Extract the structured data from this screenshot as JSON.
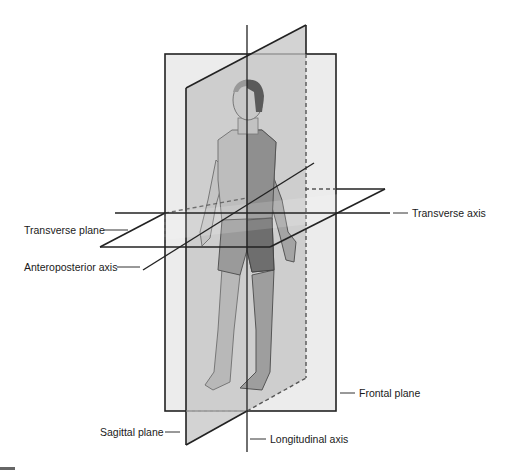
{
  "figure": {
    "colors": {
      "frontal_plane_fill": "#ececec",
      "sagittal_plane_fill": "#c8c8c8",
      "line": "#222222",
      "skin_shaded": "#b9b9b9",
      "skin_light": "#d6d6d6",
      "garment": "#7a7a7a",
      "hair": "#555555"
    },
    "labels": {
      "transverse_plane": "Transverse plane",
      "anteroposterior_axis": "Anteroposterior axis",
      "transverse_axis": "Transverse axis",
      "frontal_plane": "Frontal plane",
      "sagittal_plane": "Sagittal plane",
      "longitudinal_axis": "Longitudinal axis"
    }
  }
}
